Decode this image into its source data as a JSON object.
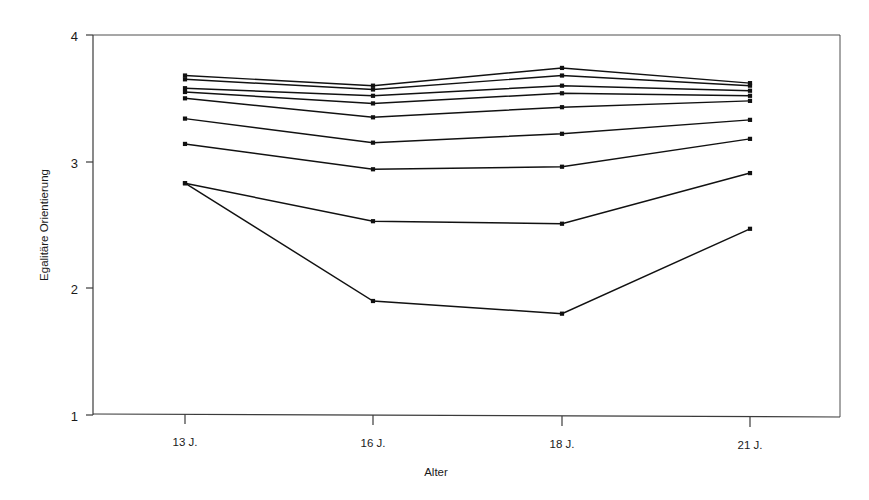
{
  "chart_data": {
    "type": "line",
    "title": "",
    "subtitle": "",
    "xlabel": "Alter",
    "ylabel": "Egalitäre Orientierung",
    "categories": [
      "13 J.",
      "16 J.",
      "18 J.",
      "21 J."
    ],
    "x_tick_labels": [
      "13 J.",
      "16 J.",
      "18 J.",
      "21 J."
    ],
    "y_tick_labels": [
      "1",
      "2",
      "3",
      "4"
    ],
    "y_ticks": [
      1,
      2,
      3,
      4
    ],
    "ylim": [
      1,
      4
    ],
    "grid": false,
    "legend": false,
    "legend_position": "none",
    "marker": "square",
    "line_color": "#111111",
    "series": [
      {
        "name": "Gruppe 1",
        "values": [
          3.68,
          3.6,
          3.74,
          3.62
        ]
      },
      {
        "name": "Gruppe 2",
        "values": [
          3.65,
          3.57,
          3.68,
          3.6
        ]
      },
      {
        "name": "Gruppe 3",
        "values": [
          3.58,
          3.52,
          3.6,
          3.56
        ]
      },
      {
        "name": "Gruppe 4",
        "values": [
          3.55,
          3.46,
          3.54,
          3.52
        ]
      },
      {
        "name": "Gruppe 5",
        "values": [
          3.5,
          3.35,
          3.43,
          3.48
        ]
      },
      {
        "name": "Gruppe 6",
        "values": [
          3.34,
          3.15,
          3.22,
          3.33
        ]
      },
      {
        "name": "Gruppe 7",
        "values": [
          3.14,
          2.94,
          2.96,
          3.18
        ]
      },
      {
        "name": "Gruppe 8",
        "values": [
          2.83,
          2.53,
          2.51,
          2.91
        ]
      },
      {
        "name": "Gruppe 9",
        "values": [
          2.83,
          1.9,
          1.8,
          2.47
        ]
      }
    ]
  },
  "axes": {
    "y_label": "Egalitäre Orientierung",
    "x_label": "Alter",
    "y_tick_4": "4",
    "y_tick_3": "3",
    "y_tick_2": "2",
    "y_tick_1": "1",
    "x_tick_1": "13 J.",
    "x_tick_2": "16 J.",
    "x_tick_3": "18 J.",
    "x_tick_4": "21 J."
  }
}
